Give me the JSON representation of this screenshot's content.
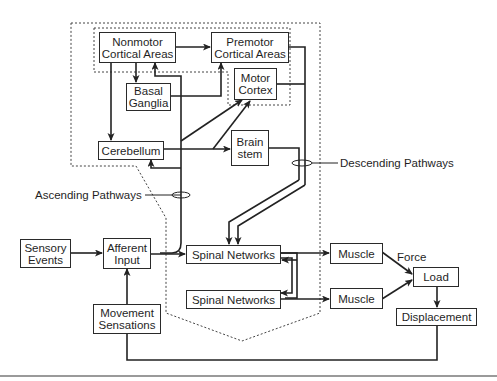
{
  "colors": {
    "line": "#222222",
    "box_border": "#2a2a2a",
    "text": "#1f1f1f",
    "dotted": "#444444",
    "separator": "#9a9a9a"
  },
  "boxes": {
    "nonmotor": {
      "line1": "Nonmotor",
      "line2": "Cortical Areas"
    },
    "premotor": {
      "line1": "Premotor",
      "line2": "Cortical Areas"
    },
    "basal": {
      "line1": "Basal",
      "line2": "Ganglia"
    },
    "motor": {
      "line1": "Motor",
      "line2": "Cortex"
    },
    "cerebellum": {
      "line1": "Cerebellum"
    },
    "brainstem": {
      "line1": "Brain",
      "line2": "stem"
    },
    "sensory": {
      "line1": "Sensory",
      "line2": "Events"
    },
    "afferent": {
      "line1": "Afferent",
      "line2": "Input"
    },
    "movement": {
      "line1": "Movement",
      "line2": "Sensations"
    },
    "spinal1": {
      "line1": "Spinal Networks"
    },
    "spinal2": {
      "line1": "Spinal Networks"
    },
    "muscle1": {
      "line1": "Muscle"
    },
    "muscle2": {
      "line1": "Muscle"
    },
    "load": {
      "line1": "Load"
    },
    "displacement": {
      "line1": "Displacement"
    }
  },
  "labels": {
    "descending": "Descending Pathways",
    "ascending": "Ascending Pathways",
    "force": "Force"
  }
}
